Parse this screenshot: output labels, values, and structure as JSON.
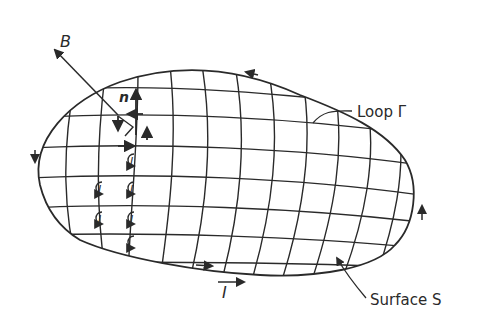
{
  "diagram": {
    "labels": {
      "field_vector": "B",
      "normal_vector": "n",
      "loop": "Loop Γ",
      "surface": "Surface S",
      "current": "I",
      "small_loop_current": "I"
    },
    "elements": {
      "loop_outline": "closed curve Γ bounding surface S",
      "surface_mesh": "curvilinear grid dividing S into small loops",
      "circulation_markers_count": 7,
      "boundary_arrow_count": 4
    },
    "colors": {
      "ink": "#2a2a2a",
      "background": "#ffffff"
    }
  }
}
